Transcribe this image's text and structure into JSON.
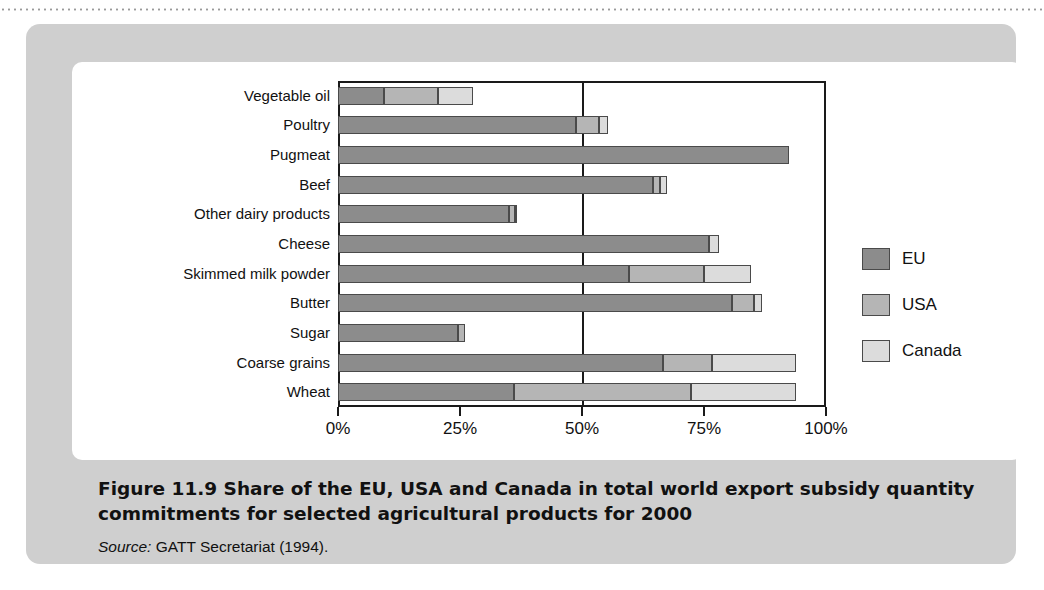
{
  "figure": {
    "caption_title": "Figure 11.9  Share of the EU, USA and Canada in total world export subsidy quantity commitments for selected agricultural products for 2000",
    "source_label": "Source:",
    "source_text": " GATT Secretariat (1994)."
  },
  "legend": {
    "items": [
      {
        "label": "EU",
        "color": "#8c8c8c",
        "key": "eu"
      },
      {
        "label": "USA",
        "color": "#b5b5b5",
        "key": "usa"
      },
      {
        "label": "Canada",
        "color": "#dcdcdc",
        "key": "canada"
      }
    ]
  },
  "axis": {
    "ticks": [
      "0%",
      "25%",
      "50%",
      "75%",
      "100%"
    ],
    "tick_values": [
      0,
      25,
      50,
      75,
      100
    ],
    "gridline_at": 50
  },
  "chart_data": {
    "type": "bar",
    "orientation": "horizontal",
    "stacked": true,
    "title": "Share of the EU, USA and Canada in total world export subsidy quantity commitments for selected agricultural products for 2000",
    "xlabel": "",
    "ylabel": "",
    "xlim": [
      0,
      100
    ],
    "xticks": [
      0,
      25,
      50,
      75,
      100
    ],
    "xticklabels": [
      "0%",
      "25%",
      "50%",
      "75%",
      "100%"
    ],
    "grid": false,
    "gridlines": [
      50
    ],
    "legend_position": "right",
    "categories": [
      "Vegetable oil",
      "Poultry",
      "Pugmeat",
      "Beef",
      "Other dairy products",
      "Cheese",
      "Skimmed milk powder",
      "Butter",
      "Sugar",
      "Coarse grains",
      "Wheat"
    ],
    "series": [
      {
        "name": "EU",
        "values": [
          9.5,
          48.8,
          92.4,
          64.5,
          35.0,
          76.0,
          59.6,
          80.7,
          24.6,
          66.6,
          36.0
        ]
      },
      {
        "name": "USA",
        "values": [
          10.9,
          4.7,
          0.0,
          1.5,
          1.2,
          0.0,
          15.4,
          4.5,
          1.4,
          10.0,
          36.3
        ]
      },
      {
        "name": "Canada",
        "values": [
          7.3,
          1.8,
          0.0,
          1.4,
          0.5,
          2.0,
          9.6,
          1.7,
          0.0,
          17.3,
          21.6
        ]
      }
    ],
    "cumulative_totals": [
      27.7,
      55.3,
      92.4,
      67.4,
      36.7,
      78.0,
      84.6,
      86.9,
      26.0,
      93.9,
      93.9
    ]
  }
}
